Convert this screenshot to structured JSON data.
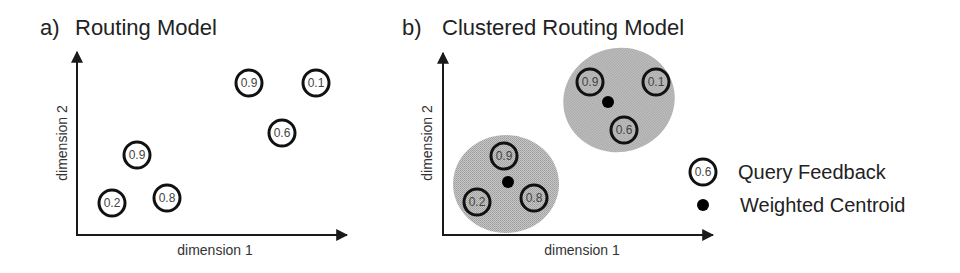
{
  "colors": {
    "axis": "#1a1a1a",
    "circle_stroke": "#111111",
    "cluster_fill": "#bdbdbd",
    "centroid": "#000000",
    "text": "#222222"
  },
  "panel_a": {
    "letter": "a)",
    "title": "Routing Model",
    "x_axis_label": "dimension 1",
    "y_axis_label": "dimension 2",
    "points": [
      {
        "label": "0.9",
        "cx": 249,
        "cy": 83
      },
      {
        "label": "0.1",
        "cx": 316,
        "cy": 83
      },
      {
        "label": "0.6",
        "cx": 282,
        "cy": 133
      },
      {
        "label": "0.9",
        "cx": 137,
        "cy": 155
      },
      {
        "label": "0.2",
        "cx": 112,
        "cy": 203
      },
      {
        "label": "0.8",
        "cx": 167,
        "cy": 198
      }
    ]
  },
  "panel_b": {
    "letter": "b)",
    "title": "Clustered Routing Model",
    "x_axis_label": "dimension 1",
    "y_axis_label": "dimension 2",
    "clusters": [
      {
        "name": "upper",
        "ellipse": {
          "cx": 619,
          "cy": 100,
          "rx": 56,
          "ry": 52,
          "rotate": -15
        },
        "centroid": {
          "cx": 608,
          "cy": 102
        },
        "points": [
          {
            "label": "0.9",
            "cx": 590,
            "cy": 82
          },
          {
            "label": "0.1",
            "cx": 656,
            "cy": 82
          },
          {
            "label": "0.6",
            "cx": 624,
            "cy": 130
          }
        ]
      },
      {
        "name": "lower",
        "ellipse": {
          "cx": 506,
          "cy": 184,
          "rx": 53,
          "ry": 49,
          "rotate": 0
        },
        "centroid": {
          "cx": 508,
          "cy": 182
        },
        "points": [
          {
            "label": "0.9",
            "cx": 504,
            "cy": 156
          },
          {
            "label": "0.2",
            "cx": 477,
            "cy": 202
          },
          {
            "label": "0.8",
            "cx": 534,
            "cy": 198
          }
        ]
      }
    ]
  },
  "legend": {
    "feedback": {
      "sample_value": "0.6",
      "label": "Query Feedback"
    },
    "centroid": {
      "label": "Weighted Centroid"
    }
  }
}
